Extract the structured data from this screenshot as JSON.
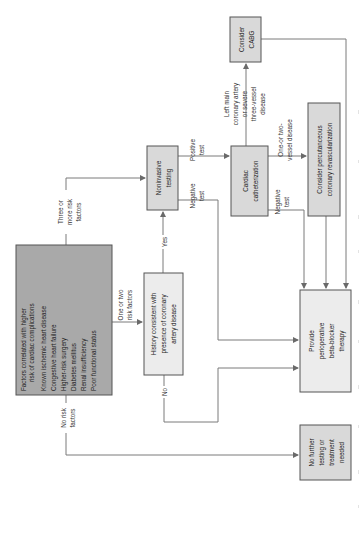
{
  "diagram": {
    "orientation": "rotated-90-ccw",
    "nodes": {
      "risk_factors": {
        "title_lines": [
          "Factors correlated with higher",
          "risk of cardiac complications"
        ],
        "items": [
          "Known ischemic heart disease",
          "Congestive heart failure",
          "Higher-risk surgery",
          "Diabetes mellitus",
          "Renal insufficiency",
          "Poor functional status"
        ]
      },
      "history": {
        "lines": [
          "History consistent with",
          "presence of coronary",
          "artery disease"
        ]
      },
      "noninvasive": {
        "lines": [
          "Noninvasive",
          "testing"
        ]
      },
      "cardiac_cath": {
        "lines": [
          "Cardiac",
          "catheterization"
        ]
      },
      "cabg": {
        "lines": [
          "Consider",
          "CABG"
        ]
      },
      "pci": {
        "lines": [
          "Consider percutanceous",
          "coronary revascularization"
        ]
      },
      "beta_blocker": {
        "lines": [
          "Provide",
          "perioperative",
          "beta-blocker",
          "therapy"
        ]
      },
      "no_further": {
        "lines": [
          "No further",
          "testing or",
          "treatment",
          "needed"
        ]
      }
    },
    "edge_labels": {
      "three_or_more": [
        "Three or",
        "more risk",
        "factors"
      ],
      "one_or_two": [
        "One or two",
        "risk factors"
      ],
      "no_risk": [
        "No risk",
        "factors"
      ],
      "yes": [
        "Yes"
      ],
      "no": [
        "No"
      ],
      "nonin_positive": [
        "Positive",
        "test"
      ],
      "nonin_negative": [
        "Negative",
        "test"
      ],
      "left_main": [
        "Left main",
        "coronary artery",
        "or severe",
        "three-vessel",
        "disease"
      ],
      "one_two_vessel": [
        "One-or two-",
        "vessel disease"
      ],
      "cath_negative": [
        "Negative",
        "test"
      ]
    },
    "colors": {
      "risk_box_fill": "#a9a9a9",
      "process_box_fill": "#d9d9d9",
      "outcome_box_fill": "#ececec",
      "line": "#7a7a7a",
      "border": "#555555"
    }
  }
}
